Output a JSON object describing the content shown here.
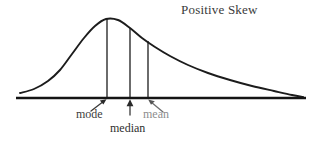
{
  "chart_data": {
    "type": "line",
    "title": "Positive Skew",
    "xlabel": "",
    "ylabel": "",
    "grid": false,
    "legend": null,
    "xlim": [
      0,
      319
    ],
    "ylim": [
      0,
      148
    ],
    "baseline": {
      "name": "x-axis",
      "x_start": 16,
      "x_end": 306,
      "y": 98
    },
    "curve": {
      "name": "distribution-curve",
      "peak_x": 106,
      "peak_y": 19,
      "left_tail_x": 20,
      "right_tail_x": 303,
      "points": [
        [
          20,
          93
        ],
        [
          34,
          89
        ],
        [
          48,
          81
        ],
        [
          60,
          70
        ],
        [
          72,
          54
        ],
        [
          84,
          38
        ],
        [
          95,
          26
        ],
        [
          106,
          19
        ],
        [
          118,
          20
        ],
        [
          130,
          28
        ],
        [
          142,
          38
        ],
        [
          155,
          47
        ],
        [
          170,
          56
        ],
        [
          188,
          65
        ],
        [
          208,
          73
        ],
        [
          230,
          80
        ],
        [
          252,
          86
        ],
        [
          274,
          91
        ],
        [
          292,
          95
        ],
        [
          303,
          97
        ]
      ]
    },
    "markers": [
      {
        "id": "mode",
        "label": "mode",
        "x": 107,
        "curve_y": 19,
        "arrow": {
          "from_x": 90,
          "from_y": 110,
          "to_x": 106,
          "to_y": 99,
          "direction": "up-right"
        }
      },
      {
        "id": "median",
        "label": "median",
        "x": 130,
        "curve_y": 28,
        "arrow": {
          "from_x": 130,
          "from_y": 113,
          "to_x": 130,
          "to_y": 99,
          "direction": "up"
        }
      },
      {
        "id": "mean",
        "label": "mean",
        "x": 148,
        "curve_y": 41,
        "arrow": {
          "from_x": 162,
          "from_y": 111,
          "to_x": 148,
          "to_y": 99,
          "direction": "up-left"
        }
      }
    ],
    "colors": {
      "background": "#ffffff",
      "ink": "#1c1c1c",
      "title_text": "#3a3a3a",
      "label_text": "#3c3c3c",
      "mean_label_text": "#8d8d8d"
    }
  }
}
